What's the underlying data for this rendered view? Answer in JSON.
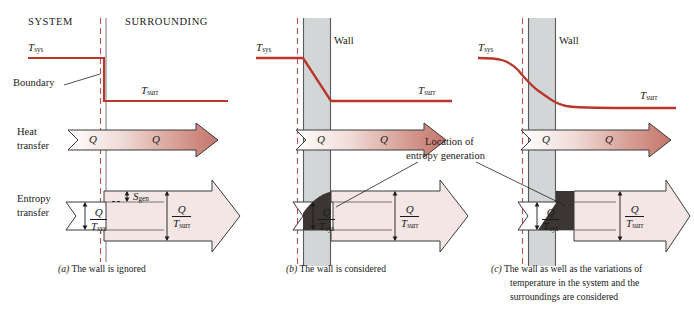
{
  "figure": {
    "type": "diagram",
    "width": 694,
    "height": 316,
    "colors": {
      "temperature_curve": "#b8362c",
      "boundary_dashed": "#c0504d",
      "wall_fill": "#d2d6d6",
      "wall_outline": "#5a5a5a",
      "entropy_arrow_fill": "#f3e6e4",
      "entropy_gen_dark": "#3b3633",
      "heat_arrow_start": "#ffffff",
      "heat_arrow_end": "#c4756a",
      "outline": "#3a3a3a",
      "text": "#1a1a1a"
    }
  },
  "panel_a": {
    "id": "a",
    "headers": {
      "left": "SYSTEM",
      "right": "SURROUNDING"
    },
    "labels": {
      "t_sys": "T",
      "t_sys_sub": "sys",
      "t_surr": "T",
      "t_surr_sub": "surr",
      "boundary": "Boundary",
      "heat_transfer_line1": "Heat",
      "heat_transfer_line2": "transfer",
      "entropy_transfer_line1": "Entropy",
      "entropy_transfer_line2": "transfer",
      "heat_in": "Q",
      "heat_out": "Q",
      "s_gen": "S",
      "s_gen_sub": "gen"
    },
    "fractions": {
      "in": {
        "num": "Q",
        "den": "T",
        "den_sub": "sys"
      },
      "out": {
        "num": "Q",
        "den": "T",
        "den_sub": "surr"
      }
    },
    "caption_marker": "(a)",
    "caption": "The wall is ignored"
  },
  "panel_b": {
    "id": "b",
    "labels": {
      "t_sys": "T",
      "t_sys_sub": "sys",
      "t_surr": "T",
      "t_surr_sub": "surr",
      "wall": "Wall",
      "heat_in": "Q",
      "heat_out": "Q"
    },
    "fractions": {
      "in": {
        "num": "Q",
        "den": "T",
        "den_sub": "sys"
      },
      "out": {
        "num": "Q",
        "den": "T",
        "den_sub": "surr"
      }
    },
    "annotation_line1": "Location of",
    "annotation_line2": "entropy generation",
    "caption_marker": "(b)",
    "caption": "The wall is considered"
  },
  "panel_c": {
    "id": "c",
    "labels": {
      "t_sys": "T",
      "t_sys_sub": "sys",
      "t_surr": "T",
      "t_surr_sub": "surr",
      "wall": "Wall",
      "heat_in": "Q",
      "heat_out": "Q"
    },
    "fractions": {
      "in": {
        "num": "Q",
        "den": "T",
        "den_sub": "sys"
      },
      "out": {
        "num": "Q",
        "den": "T",
        "den_sub": "surr"
      }
    },
    "caption_marker": "(c)",
    "caption_line1": "The wall as well as the variations of",
    "caption_line2": "temperature in the system and the",
    "caption_line3": "surroundings are considered"
  }
}
